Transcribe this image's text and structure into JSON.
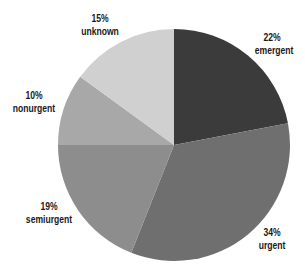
{
  "chart_data": {
    "type": "pie",
    "title": "",
    "start_angle": "12 o'clock",
    "direction": "clockwise",
    "categories": [
      "emergent",
      "urgent",
      "semiurgent",
      "nonurgent",
      "unknown"
    ],
    "values": [
      22,
      34,
      19,
      10,
      15
    ],
    "unit": "%",
    "colors": [
      "#3b3b3b",
      "#6f6f6f",
      "#8d8d8d",
      "#a8a8a8",
      "#d0d0d0"
    ],
    "labels": [
      {
        "pct": "22%",
        "name": "emergent"
      },
      {
        "pct": "34%",
        "name": "urgent"
      },
      {
        "pct": "19%",
        "name": "semiurgent"
      },
      {
        "pct": "10%",
        "name": "nonurgent"
      },
      {
        "pct": "15%",
        "name": "unknown"
      }
    ],
    "legend": "none (direct labels outside slices)"
  }
}
